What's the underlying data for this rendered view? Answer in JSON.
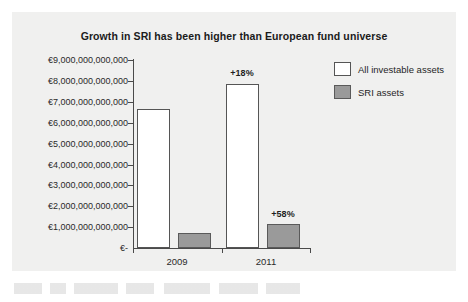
{
  "chart_data": {
    "type": "bar",
    "title": "Growth in SRI has been higher than European fund universe",
    "xlabel": "",
    "ylabel": "",
    "categories": [
      "2009",
      "2011"
    ],
    "series": [
      {
        "name": "All investable assets",
        "color": "#ffffff",
        "values": [
          6650000000000,
          7850000000000
        ],
        "point_labels": [
          "",
          "+18%"
        ]
      },
      {
        "name": "SRI assets",
        "color": "#9a9a9a",
        "values": [
          730000000000,
          1150000000000
        ],
        "point_labels": [
          "",
          "+58%"
        ]
      }
    ],
    "ylim": [
      0,
      9000000000000
    ],
    "ytick_values": [
      9000000000000,
      8000000000000,
      7000000000000,
      6000000000000,
      5000000000000,
      4000000000000,
      3000000000000,
      2000000000000,
      1000000000000,
      0
    ],
    "ytick_labels": [
      "€9,000,000,000,000",
      "€8,000,000,000,000",
      "€7,000,000,000,000",
      "€6,000,000,000,000",
      "€5,000,000,000,000",
      "€4,000,000,000,000",
      "€3,000,000,000,000",
      "€2,000,000,000,000",
      "€1,000,000,000,000",
      "€-"
    ],
    "grid": false,
    "legend_position": "top-right",
    "legend_entries": [
      "All investable assets",
      "SRI assets"
    ],
    "annotations": [
      "+18%",
      "+58%"
    ]
  },
  "legend": {
    "entries": [
      {
        "label": "All investable assets",
        "color": "#ffffff"
      },
      {
        "label": "SRI assets",
        "color": "#9a9a9a"
      }
    ]
  },
  "axis": {
    "y_labels": [
      "€9,000,000,000,000",
      "€8,000,000,000,000",
      "€7,000,000,000,000",
      "€6,000,000,000,000",
      "€5,000,000,000,000",
      "€4,000,000,000,000",
      "€3,000,000,000,000",
      "€2,000,000,000,000",
      "€1,000,000,000,000",
      "€-"
    ],
    "x_labels": [
      "2009",
      "2011"
    ]
  },
  "bar_labels": {
    "all_2011": "+18%",
    "sri_2011": "+58%"
  },
  "colors": {
    "panel_background": "#f0f0ef",
    "axis": "#4a4a4a",
    "bar_all": "#ffffff",
    "bar_sri": "#9a9a9a",
    "text": "#1f1f1f"
  }
}
